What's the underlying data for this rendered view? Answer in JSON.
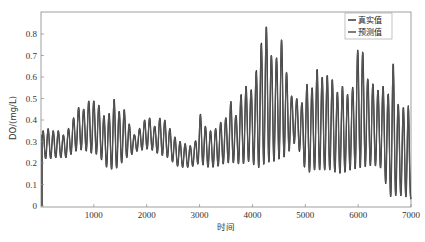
{
  "chart_data": {
    "type": "line",
    "title": "",
    "xlabel": "时间",
    "ylabel": "DO/(mg/L)",
    "xlim": [
      0,
      7000
    ],
    "ylim": [
      0,
      0.9
    ],
    "xticks": [
      1000,
      2000,
      3000,
      4000,
      5000,
      6000,
      7000
    ],
    "yticks": [
      0,
      0.1,
      0.2,
      0.3,
      0.4,
      0.5,
      0.6,
      0.7,
      0.8
    ],
    "grid": false,
    "legend_position": "upper right",
    "legend": [
      "真实值",
      "预测值"
    ],
    "series": [
      {
        "name": "真实值",
        "color": "#2b2b2b"
      },
      {
        "name": "预测值",
        "color": "#555555"
      }
    ],
    "cycle_length": 96,
    "envelope_note": "Oscillating daily-cycle DO signal; peaks/troughs per cycle estimated from figure",
    "cycles": [
      {
        "x": 40,
        "max": 0.35,
        "min": 0.22
      },
      {
        "x": 136,
        "max": 0.36,
        "min": 0.22
      },
      {
        "x": 232,
        "max": 0.35,
        "min": 0.22
      },
      {
        "x": 328,
        "max": 0.35,
        "min": 0.23
      },
      {
        "x": 424,
        "max": 0.33,
        "min": 0.22
      },
      {
        "x": 520,
        "max": 0.36,
        "min": 0.23
      },
      {
        "x": 616,
        "max": 0.41,
        "min": 0.25
      },
      {
        "x": 712,
        "max": 0.46,
        "min": 0.26
      },
      {
        "x": 808,
        "max": 0.45,
        "min": 0.26
      },
      {
        "x": 904,
        "max": 0.49,
        "min": 0.25
      },
      {
        "x": 1000,
        "max": 0.49,
        "min": 0.24
      },
      {
        "x": 1096,
        "max": 0.47,
        "min": 0.24
      },
      {
        "x": 1192,
        "max": 0.42,
        "min": 0.19
      },
      {
        "x": 1288,
        "max": 0.43,
        "min": 0.17
      },
      {
        "x": 1384,
        "max": 0.5,
        "min": 0.17
      },
      {
        "x": 1480,
        "max": 0.44,
        "min": 0.18
      },
      {
        "x": 1576,
        "max": 0.45,
        "min": 0.22
      },
      {
        "x": 1672,
        "max": 0.38,
        "min": 0.23
      },
      {
        "x": 1768,
        "max": 0.33,
        "min": 0.25
      },
      {
        "x": 1864,
        "max": 0.36,
        "min": 0.26
      },
      {
        "x": 1960,
        "max": 0.4,
        "min": 0.26
      },
      {
        "x": 2056,
        "max": 0.41,
        "min": 0.27
      },
      {
        "x": 2152,
        "max": 0.37,
        "min": 0.25
      },
      {
        "x": 2248,
        "max": 0.41,
        "min": 0.24
      },
      {
        "x": 2344,
        "max": 0.4,
        "min": 0.23
      },
      {
        "x": 2440,
        "max": 0.36,
        "min": 0.22
      },
      {
        "x": 2536,
        "max": 0.32,
        "min": 0.19
      },
      {
        "x": 2632,
        "max": 0.3,
        "min": 0.18
      },
      {
        "x": 2728,
        "max": 0.29,
        "min": 0.18
      },
      {
        "x": 2824,
        "max": 0.28,
        "min": 0.18
      },
      {
        "x": 2920,
        "max": 0.3,
        "min": 0.19
      },
      {
        "x": 3016,
        "max": 0.43,
        "min": 0.2
      },
      {
        "x": 3112,
        "max": 0.37,
        "min": 0.18
      },
      {
        "x": 3208,
        "max": 0.35,
        "min": 0.18
      },
      {
        "x": 3304,
        "max": 0.36,
        "min": 0.18
      },
      {
        "x": 3400,
        "max": 0.39,
        "min": 0.19
      },
      {
        "x": 3496,
        "max": 0.41,
        "min": 0.2
      },
      {
        "x": 3592,
        "max": 0.49,
        "min": 0.2
      },
      {
        "x": 3688,
        "max": 0.42,
        "min": 0.2
      },
      {
        "x": 3784,
        "max": 0.52,
        "min": 0.19
      },
      {
        "x": 3880,
        "max": 0.56,
        "min": 0.2
      },
      {
        "x": 3976,
        "max": 0.54,
        "min": 0.21
      },
      {
        "x": 4072,
        "max": 0.63,
        "min": 0.17
      },
      {
        "x": 4168,
        "max": 0.76,
        "min": 0.18
      },
      {
        "x": 4264,
        "max": 0.84,
        "min": 0.2
      },
      {
        "x": 4360,
        "max": 0.7,
        "min": 0.2
      },
      {
        "x": 4456,
        "max": 0.69,
        "min": 0.21
      },
      {
        "x": 4552,
        "max": 0.78,
        "min": 0.22
      },
      {
        "x": 4648,
        "max": 0.62,
        "min": 0.23
      },
      {
        "x": 4744,
        "max": 0.51,
        "min": 0.28
      },
      {
        "x": 4840,
        "max": 0.5,
        "min": 0.3
      },
      {
        "x": 4936,
        "max": 0.48,
        "min": 0.21
      },
      {
        "x": 5032,
        "max": 0.57,
        "min": 0.15
      },
      {
        "x": 5128,
        "max": 0.55,
        "min": 0.16
      },
      {
        "x": 5224,
        "max": 0.64,
        "min": 0.17
      },
      {
        "x": 5320,
        "max": 0.6,
        "min": 0.16
      },
      {
        "x": 5416,
        "max": 0.61,
        "min": 0.17
      },
      {
        "x": 5512,
        "max": 0.59,
        "min": 0.16
      },
      {
        "x": 5608,
        "max": 0.53,
        "min": 0.15
      },
      {
        "x": 5704,
        "max": 0.56,
        "min": 0.15
      },
      {
        "x": 5800,
        "max": 0.52,
        "min": 0.16
      },
      {
        "x": 5896,
        "max": 0.55,
        "min": 0.17
      },
      {
        "x": 5992,
        "max": 0.73,
        "min": 0.17
      },
      {
        "x": 6088,
        "max": 0.72,
        "min": 0.18
      },
      {
        "x": 6184,
        "max": 0.59,
        "min": 0.18
      },
      {
        "x": 6280,
        "max": 0.57,
        "min": 0.19
      },
      {
        "x": 6376,
        "max": 0.54,
        "min": 0.18
      },
      {
        "x": 6472,
        "max": 0.56,
        "min": 0.17
      },
      {
        "x": 6568,
        "max": 0.52,
        "min": 0.04
      },
      {
        "x": 6664,
        "max": 0.67,
        "min": 0.04
      },
      {
        "x": 6760,
        "max": 0.47,
        "min": 0.05
      },
      {
        "x": 6856,
        "max": 0.46,
        "min": 0.04
      },
      {
        "x": 6952,
        "max": 0.47,
        "min": 0.04
      },
      {
        "x": 7000,
        "max": 0.13,
        "min": 0.03
      }
    ],
    "start_spike": {
      "x": 20,
      "from": 0.0,
      "to": 0.33
    }
  }
}
